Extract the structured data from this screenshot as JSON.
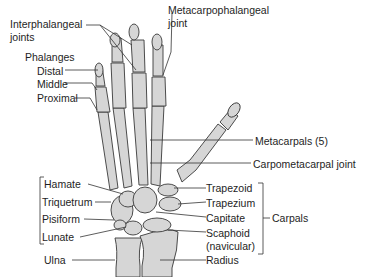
{
  "diagram": {
    "labels": {
      "interphalangeal": "Interphalangeal",
      "interphalangeal_2": "joints",
      "metacarpophalangeal": "Metacarpophalangeal",
      "metacarpophalangeal_2": "joint",
      "phalanges": "Phalanges",
      "distal": "Distal",
      "middle": "Middle",
      "proximal": "Proximal",
      "metacarpals": "Metacarpals (5)",
      "carpometacarpal": "Carpometacarpal joint",
      "hamate": "Hamate",
      "triquetrum": "Triquetrum",
      "pisiform": "Pisiform",
      "lunate": "Lunate",
      "trapezoid": "Trapezoid",
      "trapezium": "Trapezium",
      "capitate": "Capitate",
      "scaphoid": "Scaphoid",
      "scaphoid_2": "(navicular)",
      "carpals": "Carpals",
      "ulna": "Ulna",
      "radius": "Radius"
    },
    "colors": {
      "bone_fill": "#d6d6d6",
      "outline": "#3a3a3a",
      "text": "#1e1e1e"
    }
  }
}
